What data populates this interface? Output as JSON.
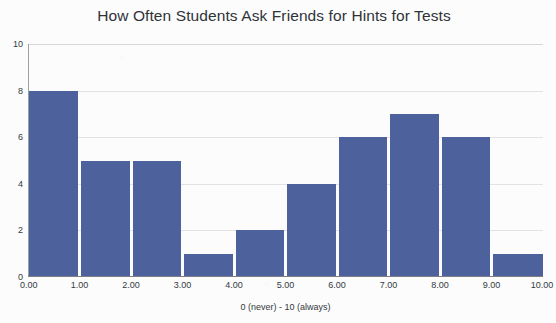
{
  "chart_data": {
    "type": "bar",
    "title": "How Often Students Ask Friends for Hints for Tests",
    "xlabel": "0 (never) - 10 (always)",
    "ylabel": "",
    "bin_edges": [
      0,
      1,
      2,
      3,
      4,
      5,
      6,
      7,
      8,
      9,
      10
    ],
    "categories": [
      "0-1",
      "1-2",
      "2-3",
      "3-4",
      "4-5",
      "5-6",
      "6-7",
      "7-8",
      "8-9",
      "9-10"
    ],
    "values": [
      8,
      5,
      5,
      1,
      2,
      4,
      6,
      7,
      6,
      1
    ],
    "xlim": [
      0,
      10
    ],
    "ylim": [
      0,
      10
    ],
    "x_tick_labels": [
      "0.00",
      "1.00",
      "2.00",
      "3.00",
      "4.00",
      "5.00",
      "6.00",
      "7.00",
      "8.00",
      "9.00",
      "10.00"
    ],
    "x_tick_values": [
      0,
      1,
      2,
      3,
      4,
      5,
      6,
      7,
      8,
      9,
      10
    ],
    "y_tick_labels": [
      "0",
      "2",
      "4",
      "6",
      "8",
      "10"
    ],
    "y_tick_values": [
      0,
      2,
      4,
      6,
      8,
      10
    ],
    "grid": true,
    "grid_axis": "y",
    "legend": false,
    "bar_color": "#4d629c",
    "background_color": "#fcfcfc",
    "gridline_color": "#e2e2e4",
    "axis_color": "#7b7f86",
    "text_color": "#333a41"
  }
}
